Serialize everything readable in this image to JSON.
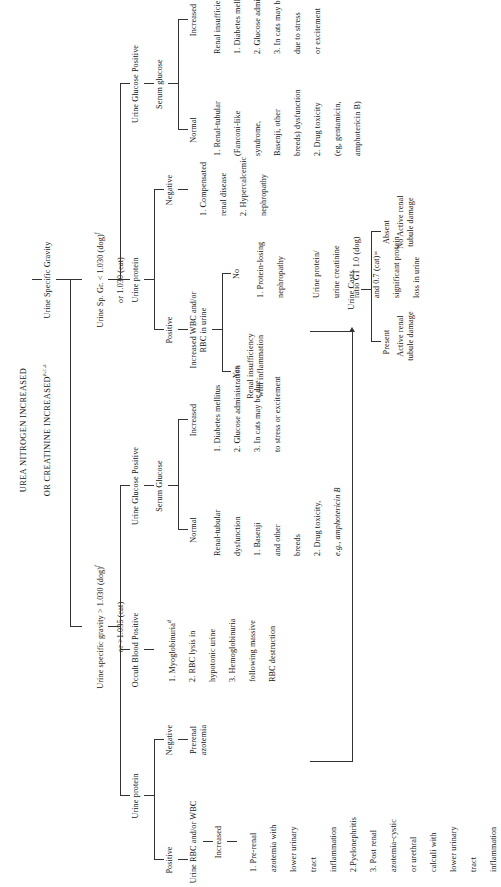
{
  "figure": {
    "header_line1": "UREA NITROGEN INCREASED",
    "header_line2": "OR CREATININE INCREASED",
    "header_line2_sup": "b,c,e",
    "root": "Urine Specific Gravity"
  },
  "branch_left": {
    "label_line1": "Urine specific gravity > 1.030 (dog)",
    "label_line1_sup": "f",
    "label_line2": "or >1.035 (cat)",
    "test": "Urine protein",
    "negative": {
      "label": "Negative",
      "result": "Prerenal\nazotemia"
    },
    "positive": {
      "label": "Positive",
      "test": "Urine RBC and/or WBC",
      "increased": {
        "label": "Increased",
        "items": [
          "1. Pre-renal",
          "azotemia with",
          "lower urinary",
          "tract",
          "inflammation",
          "2.Pyelonephritis",
          "3. Post renal",
          "azotemia-cystic",
          "or urethral",
          "calculi with",
          "lower urinary",
          "tract",
          "inflammation"
        ]
      }
    },
    "occult_blood": {
      "label": "Occult Blood Positive",
      "items": [
        "1. Myoglobinuria",
        "2. RBC lysis in",
        "hypotonic urine",
        "3. Hemoglobinuria",
        "following massive",
        "RBC destruction"
      ],
      "sup_on_item1": "d"
    },
    "urine_glucose": {
      "label": "Urine Glucose Positive",
      "test": "Serum Glucose",
      "normal": {
        "label": "Normal",
        "items": [
          "Renal-tubular",
          "dysfunction",
          "1. Basenji",
          "and other",
          "breeds",
          "2. Drug toxicity,",
          "e.g., amphotericin B"
        ]
      },
      "increased": {
        "label": "Increased",
        "items": [
          "1. Diabetes mellitus",
          "2. Glucose administration",
          "3. In cats may be due",
          "to stress or excitement"
        ]
      }
    }
  },
  "branch_right": {
    "label_line1": "Urine Sp. Gr. < 1.030 (dog)",
    "label_line1_sup": "f",
    "label_line2": "or 1.030 (cat)",
    "urine_protein": {
      "label": "Urine protein",
      "positive": {
        "label": "Positive",
        "test": "Increased WBC and/or\nRBC in urine",
        "yes": {
          "label": "Yes",
          "result": "Renal insufficiency\nwith inflammation"
        },
        "no": {
          "label": "No",
          "items": [
            "1. Protein-losing",
            "nephropathy",
            "",
            "Urine protein/",
            "urine creatinine",
            "ratio GT 1.0 (dog)",
            "and 0.7 (cat)=",
            "significant protein",
            "loss in urine"
          ]
        }
      },
      "negative": {
        "label": "Negative",
        "items": [
          "1. Compensated",
          "renal disease",
          "2. Hypercalcemic",
          "nephropathy"
        ]
      }
    },
    "urine_glucose": {
      "label": "Urine Glucose Positive",
      "test": "Serum glucose",
      "normal": {
        "label": "Normal",
        "items": [
          "1. Renal-tubular",
          "(Fanconi-like",
          "syndrome,",
          "Basenji, other",
          "breeds) dysfunction",
          "2. Drug toxicity",
          "(eg, gentamicin,",
          "amphotericin B)"
        ]
      },
      "increased": {
        "label": "Increased",
        "items": [
          "Renal insufficiency with:",
          "1. Diabetes mellitus",
          "2. Glucose administration",
          "3. In cats may be",
          "due to stress",
          "or excitement"
        ]
      }
    }
  },
  "urine_casts": {
    "label": "Urine Casts",
    "present": {
      "label": "Present",
      "result": "Active renal\ntubule damage"
    },
    "absent": {
      "label": "Absent",
      "result": "No Active renal\ntubule damage"
    }
  }
}
